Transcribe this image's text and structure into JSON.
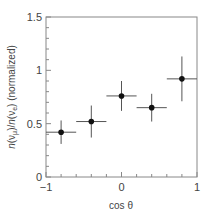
{
  "chart_data": {
    "type": "scatter",
    "title": "",
    "xlabel": "cos θ",
    "ylabel": "n(νμ)/n(νe) (normalized)",
    "xlim": [
      -1,
      1
    ],
    "ylim": [
      0,
      1.5
    ],
    "x_ticks": [
      -1,
      0,
      1
    ],
    "x_tick_labels": [
      "−1",
      "0",
      "1"
    ],
    "x_minor_step": 0.2,
    "y_ticks": [
      0,
      0.5,
      1,
      1.5
    ],
    "y_tick_labels": [
      "0",
      "0.5",
      "1",
      "1.5"
    ],
    "y_minor_step": 0.1,
    "grid": false,
    "legend": null,
    "series": [
      {
        "name": "data",
        "marker": "filled-circle",
        "color": "#111111",
        "points": [
          {
            "x": -0.8,
            "y": 0.42,
            "xerr": 0.2,
            "yerr": 0.11
          },
          {
            "x": -0.4,
            "y": 0.52,
            "xerr": 0.2,
            "yerr": 0.15
          },
          {
            "x": 0.0,
            "y": 0.76,
            "xerr": 0.2,
            "yerr": 0.14
          },
          {
            "x": 0.4,
            "y": 0.65,
            "xerr": 0.2,
            "yerr": 0.13
          },
          {
            "x": 0.8,
            "y": 0.92,
            "xerr": 0.2,
            "yerr": 0.21
          }
        ]
      }
    ]
  },
  "colors": {
    "axis": "#888888",
    "errorbar": "#555555",
    "marker": "#111111"
  }
}
